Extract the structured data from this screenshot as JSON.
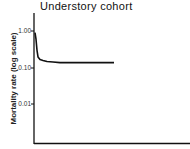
{
  "chart_data": {
    "type": "line",
    "title": "Understory cohort",
    "xlabel": "",
    "ylabel": "Mortality rate (log scale)",
    "yscale": "log",
    "y_ticks": [
      "1.00",
      "0.10",
      "0.01"
    ],
    "ylim": [
      0.003,
      2.0
    ],
    "grid": false,
    "legend": null,
    "series": [
      {
        "name": "Understory cohort",
        "x": [
          0,
          1,
          2,
          3,
          5,
          8,
          12,
          18,
          25,
          35,
          50,
          65,
          79
        ],
        "values": [
          0.9,
          0.6,
          0.3,
          0.2,
          0.17,
          0.16,
          0.15,
          0.145,
          0.14,
          0.14,
          0.14,
          0.14,
          0.14
        ]
      }
    ]
  }
}
